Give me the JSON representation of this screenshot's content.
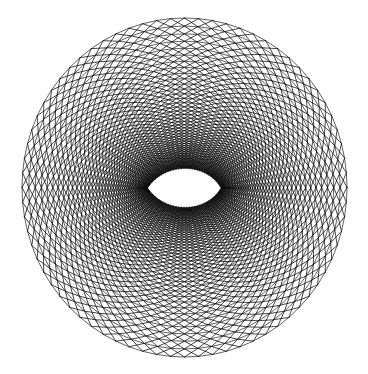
{
  "figure": {
    "kind": "cfd-o-grid-mesh",
    "title": "",
    "width": 368,
    "height": 374,
    "background_color": "#ffffff",
    "line_color": "#000000"
  },
  "chart_data": {
    "type": "scatter",
    "title": "",
    "subtitle": "",
    "xlabel": "",
    "ylabel": "",
    "legend": [],
    "annotations": [],
    "grid": true,
    "axes_visible": false,
    "tick_labels_x": [],
    "tick_labels_y": [],
    "mesh": {
      "topology": "O-grid",
      "center_x": 184.5,
      "center_y": 187.5,
      "outer_radius_x": 162.5,
      "outer_radius_y": 169.5,
      "angular_divisions": 72,
      "radial_levels": 44,
      "first_layer_radius": 7.5,
      "growth_ratio": 1.092,
      "ring_line_width": 0.62,
      "spoke_line_width": 0.72,
      "spoke_offset_index": 1,
      "spoke_style": "alternating-zigzag",
      "ring_squash_y": 1.043,
      "wake_axis_angle_deg": 0
    },
    "airfoil": {
      "name": "symmetric-airfoil",
      "fill_color": "#ffffff",
      "chord_px": 38,
      "thickness_ratio": 0.115,
      "leading_edge_x": 165.0,
      "leading_edge_y": 188.0,
      "trailing_edge_x": 203.0,
      "trailing_edge_y": 188.0,
      "angle_of_attack_deg": 0
    }
  }
}
